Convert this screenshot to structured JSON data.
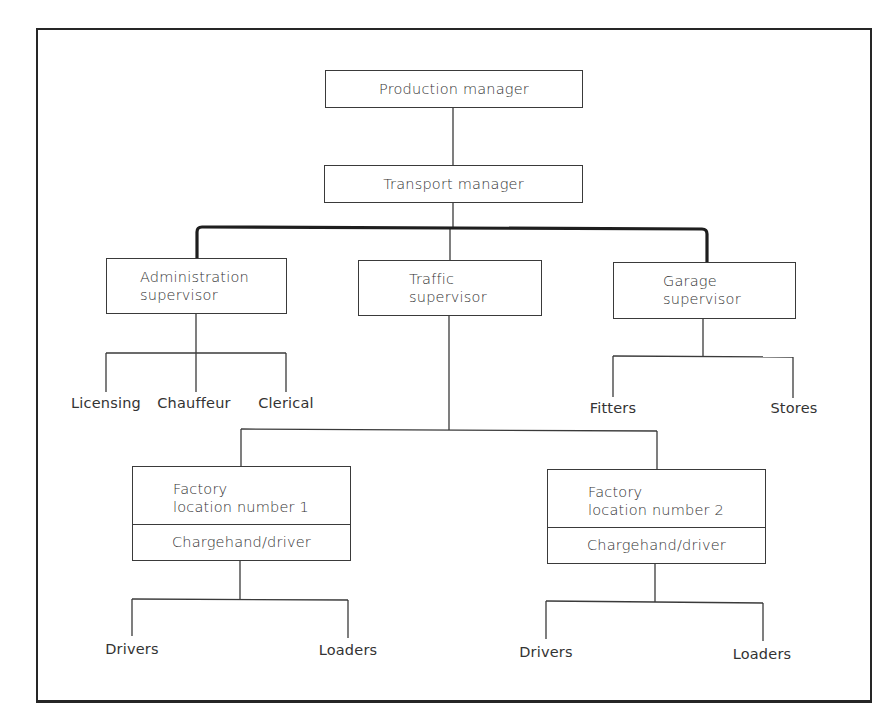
{
  "chart": {
    "type": "org-chart",
    "nodes": {
      "production_manager": "Production manager",
      "transport_manager": "Transport manager",
      "admin_supervisor": [
        "Administration",
        "supervisor"
      ],
      "traffic_supervisor": [
        "Traffic",
        "supervisor"
      ],
      "garage_supervisor": [
        "Garage",
        "supervisor"
      ],
      "factory1": [
        "Factory",
        "location number 1"
      ],
      "factory1_sub": "Chargehand/driver",
      "factory2": [
        "Factory",
        "location number 2"
      ],
      "factory2_sub": "Chargehand/driver"
    },
    "leaves": {
      "admin": [
        "Licensing",
        "Chauffeur",
        "Clerical"
      ],
      "garage": [
        "Fitters",
        "Stores"
      ],
      "factory1": [
        "Drivers",
        "Loaders"
      ],
      "factory2": [
        "Drivers",
        "Loaders"
      ]
    },
    "hierarchy": {
      "Production manager": {
        "Transport manager": {
          "Administration supervisor": [
            "Licensing",
            "Chauffeur",
            "Clerical"
          ],
          "Traffic supervisor": {
            "Factory location number 1 / Chargehand/driver": [
              "Drivers",
              "Loaders"
            ],
            "Factory location number 2 / Chargehand/driver": [
              "Drivers",
              "Loaders"
            ]
          },
          "Garage supervisor": [
            "Fitters",
            "Stores"
          ]
        }
      }
    }
  }
}
